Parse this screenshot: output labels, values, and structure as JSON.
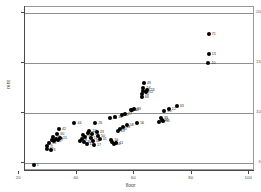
{
  "chart_data": {
    "type": "scatter",
    "title": "",
    "xlabel": "floor",
    "ylabel": "rent",
    "xlim": [
      22,
      102
    ],
    "ylim": [
      4.2,
      20.6
    ],
    "grid": true,
    "gridlines_y": [
      20,
      15,
      10,
      5
    ],
    "xticks": [
      20,
      40,
      60,
      80,
      100
    ],
    "yticks": [
      20,
      15,
      10,
      5
    ],
    "legend": "none",
    "marker": "filled-circle",
    "marker_color": "#000000",
    "labels_position": "right-of-marker",
    "points": [
      {
        "label": "1",
        "x": 25.0,
        "y": 4.8
      },
      {
        "label": "25",
        "x": 29.5,
        "y": 6.4
      },
      {
        "label": "9",
        "x": 29.8,
        "y": 6.7
      },
      {
        "label": "45",
        "x": 30.4,
        "y": 7.0
      },
      {
        "label": "3",
        "x": 30.9,
        "y": 6.3
      },
      {
        "label": "30",
        "x": 31.4,
        "y": 7.3
      },
      {
        "label": "48",
        "x": 31.8,
        "y": 7.6
      },
      {
        "label": "53",
        "x": 32.2,
        "y": 7.2
      },
      {
        "label": "37",
        "x": 32.8,
        "y": 7.4
      },
      {
        "label": "60",
        "x": 33.2,
        "y": 7.9
      },
      {
        "label": "7",
        "x": 33.6,
        "y": 7.3
      },
      {
        "label": "42",
        "x": 33.8,
        "y": 8.4
      },
      {
        "label": "15",
        "x": 34.2,
        "y": 7.5
      },
      {
        "label": "44",
        "x": 39.2,
        "y": 9.0
      },
      {
        "label": "40",
        "x": 41.0,
        "y": 7.2
      },
      {
        "label": "5",
        "x": 41.8,
        "y": 7.4
      },
      {
        "label": "19",
        "x": 42.2,
        "y": 7.8
      },
      {
        "label": "36",
        "x": 42.6,
        "y": 7.1
      },
      {
        "label": "61",
        "x": 43.0,
        "y": 7.6
      },
      {
        "label": "14",
        "x": 43.4,
        "y": 6.9
      },
      {
        "label": "27",
        "x": 43.8,
        "y": 8.0
      },
      {
        "label": "22",
        "x": 44.4,
        "y": 8.2
      },
      {
        "label": "51",
        "x": 44.8,
        "y": 7.5
      },
      {
        "label": "29",
        "x": 45.2,
        "y": 7.9
      },
      {
        "label": "38",
        "x": 45.6,
        "y": 7.2
      },
      {
        "label": "17",
        "x": 46.0,
        "y": 6.8
      },
      {
        "label": "26",
        "x": 46.4,
        "y": 9.0
      },
      {
        "label": "23",
        "x": 47.0,
        "y": 8.1
      },
      {
        "label": "50",
        "x": 47.4,
        "y": 7.7
      },
      {
        "label": "31",
        "x": 48.0,
        "y": 7.4
      },
      {
        "label": "24",
        "x": 51.5,
        "y": 9.5
      },
      {
        "label": "16",
        "x": 52.0,
        "y": 7.3
      },
      {
        "label": "8",
        "x": 52.4,
        "y": 7.1
      },
      {
        "label": "46",
        "x": 52.8,
        "y": 6.9
      },
      {
        "label": "34",
        "x": 53.4,
        "y": 9.6
      },
      {
        "label": "11",
        "x": 53.8,
        "y": 7.0
      },
      {
        "label": "43",
        "x": 54.3,
        "y": 8.2
      },
      {
        "label": "35",
        "x": 55.0,
        "y": 8.4
      },
      {
        "label": "21",
        "x": 55.6,
        "y": 9.8
      },
      {
        "label": "18",
        "x": 56.2,
        "y": 8.6
      },
      {
        "label": "27",
        "x": 56.8,
        "y": 9.9
      },
      {
        "label": "58",
        "x": 57.4,
        "y": 8.8
      },
      {
        "label": "30",
        "x": 58.8,
        "y": 10.3
      },
      {
        "label": "57",
        "x": 59.3,
        "y": 10.3
      },
      {
        "label": "59",
        "x": 59.9,
        "y": 10.4
      },
      {
        "label": "56",
        "x": 61.0,
        "y": 9.0
      },
      {
        "label": "68",
        "x": 62.6,
        "y": 11.6
      },
      {
        "label": "62",
        "x": 62.8,
        "y": 11.9
      },
      {
        "label": "32",
        "x": 63.0,
        "y": 12.2
      },
      {
        "label": "54",
        "x": 63.2,
        "y": 12.5
      },
      {
        "label": "49",
        "x": 63.4,
        "y": 13.0
      },
      {
        "label": "23",
        "x": 64.6,
        "y": 12.3
      },
      {
        "label": "52",
        "x": 64.2,
        "y": 12.1
      },
      {
        "label": "47",
        "x": 68.5,
        "y": 9.1
      },
      {
        "label": "39",
        "x": 69.3,
        "y": 9.5
      },
      {
        "label": "41",
        "x": 69.6,
        "y": 9.3
      },
      {
        "label": "55",
        "x": 69.9,
        "y": 9.2
      },
      {
        "label": "20",
        "x": 70.5,
        "y": 10.2
      },
      {
        "label": "12",
        "x": 72.0,
        "y": 10.4
      },
      {
        "label": "33",
        "x": 74.8,
        "y": 10.7
      },
      {
        "label": "10",
        "x": 85.8,
        "y": 15.0
      },
      {
        "label": "13",
        "x": 85.9,
        "y": 15.9
      },
      {
        "label": "71",
        "x": 85.9,
        "y": 17.9
      }
    ]
  }
}
